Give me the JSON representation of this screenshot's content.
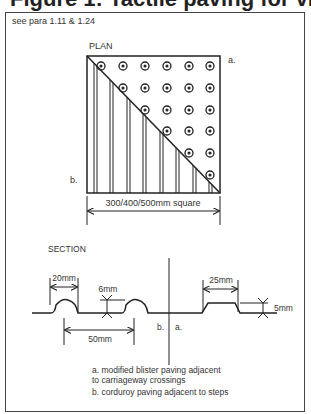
{
  "title": "Figure 1: Tactile paving for visually impaired",
  "reference": "see para 1.11 & 1.24",
  "plan": {
    "heading": "PLAN",
    "label_a": "a.",
    "label_b": "b.",
    "dimension": "300/400/500mm square",
    "blister_grid": "6 x 6 triangular (upper-right)",
    "corduroy": "vertical ribs (lower-left)"
  },
  "section": {
    "heading": "SECTION",
    "dim_blister_width": "20mm",
    "dim_blister_height": "6mm",
    "dim_blister_spacing": "50mm",
    "dim_corduroy_width": "25mm",
    "dim_corduroy_height": "5mm",
    "label_b": "b.",
    "label_a": "a."
  },
  "legend": {
    "a_line1": "a. modified blister paving adjacent",
    "a_line2": "to carriageway crossings",
    "b": "b. corduroy paving adjacent to steps"
  },
  "colors": {
    "ink": "#222222",
    "frame": "#444444",
    "background": "#ffffff"
  }
}
